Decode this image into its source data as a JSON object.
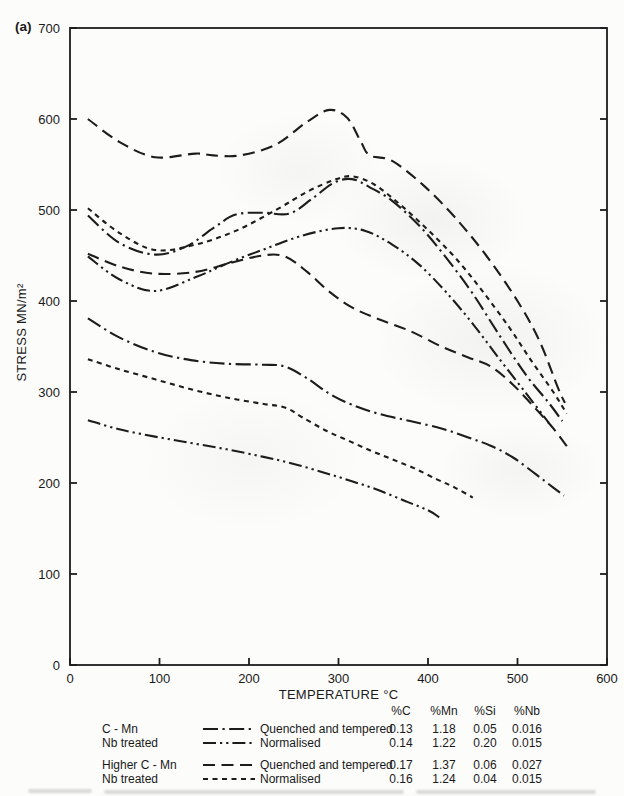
{
  "figure": {
    "panel_label": "(a)",
    "x_axis_label": "TEMPERATURE °C",
    "y_axis_label": "STRESS MN/m²"
  },
  "chart_data": {
    "type": "line",
    "title": "",
    "xlabel": "TEMPERATURE °C",
    "ylabel": "STRESS MN/m²",
    "xlim": [
      0,
      600
    ],
    "ylim": [
      0,
      700
    ],
    "x_ticks": [
      0,
      100,
      200,
      300,
      400,
      500,
      600
    ],
    "y_ticks": [
      0,
      100,
      200,
      300,
      400,
      500,
      600,
      700
    ],
    "grid": false,
    "legend_position": "below",
    "line_color": "#1c1c1c",
    "styles": {
      "dash_dot": [
        15,
        4.5,
        2.2,
        4.5
      ],
      "dash_dot_dot": [
        13,
        4,
        2.2,
        4,
        2.2,
        4
      ],
      "long_dash": [
        12,
        6.5
      ],
      "short_dash": [
        5,
        4.5
      ]
    },
    "series": [
      {
        "name": "higher-c-mn-quenched-tempered-upper",
        "style": "long_dash",
        "points": [
          [
            20,
            600
          ],
          [
            55,
            575
          ],
          [
            95,
            558
          ],
          [
            140,
            562
          ],
          [
            160,
            560
          ],
          [
            190,
            560
          ],
          [
            230,
            572
          ],
          [
            265,
            597
          ],
          [
            290,
            610
          ],
          [
            310,
            601
          ],
          [
            325,
            575
          ],
          [
            335,
            560
          ],
          [
            360,
            554
          ],
          [
            395,
            527
          ],
          [
            430,
            492
          ],
          [
            465,
            450
          ],
          [
            500,
            400
          ],
          [
            525,
            355
          ],
          [
            545,
            305
          ],
          [
            553,
            288
          ]
        ]
      },
      {
        "name": "nb-treated-normalised-upper",
        "style": "short_dash",
        "points": [
          [
            20,
            502
          ],
          [
            55,
            475
          ],
          [
            95,
            456
          ],
          [
            140,
            462
          ],
          [
            185,
            477
          ],
          [
            230,
            500
          ],
          [
            265,
            520
          ],
          [
            295,
            533
          ],
          [
            315,
            537
          ],
          [
            340,
            528
          ],
          [
            370,
            505
          ],
          [
            400,
            478
          ],
          [
            430,
            448
          ],
          [
            460,
            412
          ],
          [
            490,
            372
          ],
          [
            515,
            335
          ],
          [
            540,
            300
          ],
          [
            555,
            276
          ]
        ]
      },
      {
        "name": "c-mn-quenched-tempered-upper",
        "style": "dash_dot",
        "points": [
          [
            20,
            494
          ],
          [
            55,
            464
          ],
          [
            95,
            451
          ],
          [
            130,
            460
          ],
          [
            160,
            480
          ],
          [
            185,
            495
          ],
          [
            215,
            497
          ],
          [
            245,
            496
          ],
          [
            270,
            512
          ],
          [
            295,
            530
          ],
          [
            315,
            534
          ],
          [
            335,
            525
          ],
          [
            360,
            510
          ],
          [
            390,
            483
          ],
          [
            420,
            448
          ],
          [
            450,
            408
          ],
          [
            480,
            362
          ],
          [
            510,
            318
          ],
          [
            535,
            288
          ],
          [
            550,
            268
          ]
        ]
      },
      {
        "name": "nb-treated-normalised-second-upper",
        "style": "dash_dot_dot",
        "points": [
          [
            20,
            449
          ],
          [
            55,
            424
          ],
          [
            95,
            411
          ],
          [
            140,
            426
          ],
          [
            180,
            443
          ],
          [
            220,
            458
          ],
          [
            260,
            472
          ],
          [
            300,
            480
          ],
          [
            330,
            477
          ],
          [
            360,
            462
          ],
          [
            390,
            440
          ],
          [
            420,
            410
          ],
          [
            450,
            375
          ],
          [
            480,
            336
          ],
          [
            510,
            298
          ],
          [
            535,
            266
          ]
        ]
      },
      {
        "name": "higher-c-mn-quenched-tempered-lower",
        "style": "long_dash",
        "points": [
          [
            20,
            452
          ],
          [
            55,
            438
          ],
          [
            95,
            430
          ],
          [
            140,
            432
          ],
          [
            180,
            442
          ],
          [
            215,
            450
          ],
          [
            240,
            449
          ],
          [
            265,
            432
          ],
          [
            290,
            410
          ],
          [
            315,
            393
          ],
          [
            345,
            380
          ],
          [
            380,
            367
          ],
          [
            415,
            350
          ],
          [
            445,
            338
          ],
          [
            470,
            328
          ],
          [
            495,
            308
          ],
          [
            520,
            282
          ],
          [
            540,
            260
          ],
          [
            557,
            238
          ]
        ]
      },
      {
        "name": "c-mn-quenched-tempered-lower",
        "style": "dash_dot",
        "points": [
          [
            20,
            381
          ],
          [
            55,
            360
          ],
          [
            95,
            344
          ],
          [
            135,
            335
          ],
          [
            175,
            331
          ],
          [
            215,
            330
          ],
          [
            240,
            328
          ],
          [
            265,
            315
          ],
          [
            290,
            298
          ],
          [
            315,
            286
          ],
          [
            345,
            276
          ],
          [
            380,
            268
          ],
          [
            415,
            260
          ],
          [
            445,
            250
          ],
          [
            470,
            241
          ],
          [
            495,
            228
          ],
          [
            520,
            210
          ],
          [
            540,
            195
          ],
          [
            552,
            186
          ]
        ]
      },
      {
        "name": "nb-treated-normalised-lower",
        "style": "short_dash",
        "points": [
          [
            20,
            336
          ],
          [
            55,
            325
          ],
          [
            95,
            314
          ],
          [
            135,
            303
          ],
          [
            175,
            294
          ],
          [
            215,
            287
          ],
          [
            240,
            283
          ],
          [
            260,
            272
          ],
          [
            285,
            258
          ],
          [
            310,
            247
          ],
          [
            335,
            236
          ],
          [
            360,
            226
          ],
          [
            385,
            216
          ],
          [
            410,
            204
          ],
          [
            430,
            195
          ],
          [
            450,
            184
          ]
        ]
      },
      {
        "name": "nb-treated-normalised-second-lower",
        "style": "dash_dot_dot",
        "points": [
          [
            20,
            269
          ],
          [
            55,
            259
          ],
          [
            95,
            251
          ],
          [
            135,
            244
          ],
          [
            175,
            237
          ],
          [
            215,
            229
          ],
          [
            250,
            221
          ],
          [
            285,
            211
          ],
          [
            315,
            202
          ],
          [
            345,
            192
          ],
          [
            375,
            180
          ],
          [
            400,
            170
          ],
          [
            413,
            162
          ]
        ]
      }
    ]
  },
  "legend": {
    "headers": [
      "%C",
      "%Mn",
      "%Si",
      "%Nb"
    ],
    "rows": [
      {
        "material": "C - Mn",
        "style": "dash_dot",
        "condition": "Quenched and tempered",
        "c": "0.13",
        "mn": "1.18",
        "si": "0.05",
        "nb": "0.016"
      },
      {
        "material": "Nb treated",
        "style": "dash_dot_dot",
        "condition": "Normalised",
        "c": "0.14",
        "mn": "1.22",
        "si": "0.20",
        "nb": "0.015"
      },
      {
        "material": "Higher C - Mn",
        "style": "long_dash",
        "condition": "Quenched and tempered",
        "c": "0.17",
        "mn": "1.37",
        "si": "0.06",
        "nb": "0.027"
      },
      {
        "material": "Nb treated",
        "style": "short_dash",
        "condition": "Normalised",
        "c": "0.16",
        "mn": "1.24",
        "si": "0.04",
        "nb": "0.015"
      }
    ]
  }
}
